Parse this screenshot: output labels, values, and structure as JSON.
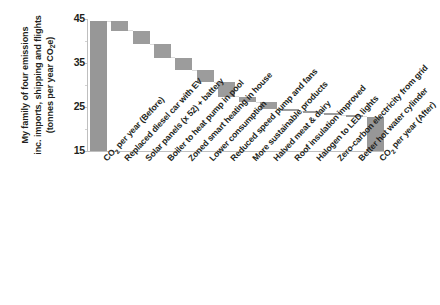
{
  "chart_data": {
    "type": "bar",
    "subtype": "waterfall",
    "title": "",
    "xlabel": "",
    "ylabel": "My family of four emissions inc. imports, shipping and flights (tonnes per year CO2e)",
    "ylabel_lines": [
      "My family of four emissions",
      "inc. imports, shipping and flights",
      "(tonnes per year CO₂e)"
    ],
    "ylim": [
      15,
      45
    ],
    "yticks": [
      15,
      25,
      35,
      45
    ],
    "ytick_labels": [
      "15",
      "25",
      "35",
      "45"
    ],
    "grid": false,
    "legend": false,
    "bar_color": "#9c9c9c",
    "axis_color": "#bfbfbf",
    "categories": [
      "CO2 per year (Before)",
      "Replaced diesel car with EV",
      "Solar panels (x 52) + battery",
      "Boiler to heat pump in pool",
      "Zoned smart heating in house",
      "Lower consumption",
      "Reduced speed pump and fans",
      "More sustainable products",
      "Halved meat & dairy",
      "Roof insulation improved",
      "Halogen to LED lights",
      "Zero-carbon electricity from grid",
      "Better hot water cylinder",
      "CO2 per year (After)"
    ],
    "bars": [
      {
        "label": "CO2 per year (Before)",
        "kind": "total",
        "bottom": 15.0,
        "top": 44.5,
        "delta": 29.5
      },
      {
        "label": "Replaced diesel car with EV",
        "kind": "step",
        "bottom": 42.3,
        "top": 44.5,
        "delta": -2.2
      },
      {
        "label": "Solar panels (x 52) + battery",
        "kind": "step",
        "bottom": 39.3,
        "top": 42.3,
        "delta": -3.0
      },
      {
        "label": "Boiler to heat pump in pool",
        "kind": "step",
        "bottom": 36.2,
        "top": 39.3,
        "delta": -3.1
      },
      {
        "label": "Zoned smart heating in house",
        "kind": "step",
        "bottom": 33.3,
        "top": 36.2,
        "delta": -2.9
      },
      {
        "label": "Lower consumption",
        "kind": "step",
        "bottom": 30.7,
        "top": 33.3,
        "delta": -2.6
      },
      {
        "label": "Reduced speed pump and fans",
        "kind": "step",
        "bottom": 27.3,
        "top": 30.7,
        "delta": -3.4
      },
      {
        "label": "More sustainable products",
        "kind": "step",
        "bottom": 26.1,
        "top": 27.3,
        "delta": -1.2
      },
      {
        "label": "Halved meat & dairy",
        "kind": "step",
        "bottom": 24.6,
        "top": 26.1,
        "delta": -1.5
      },
      {
        "label": "Roof insulation improved",
        "kind": "step",
        "bottom": 24.1,
        "top": 24.6,
        "delta": -0.5
      },
      {
        "label": "Halogen to LED lights",
        "kind": "step",
        "bottom": 23.6,
        "top": 24.1,
        "delta": -0.5
      },
      {
        "label": "Zero-carbon electricity from grid",
        "kind": "step",
        "bottom": 23.2,
        "top": 23.6,
        "delta": -0.4
      },
      {
        "label": "Better hot water cylinder",
        "kind": "step",
        "bottom": 22.8,
        "top": 23.2,
        "delta": -0.4
      },
      {
        "label": "CO2 per year (After)",
        "kind": "total",
        "bottom": 15.0,
        "top": 22.8,
        "delta": 7.8
      }
    ]
  }
}
